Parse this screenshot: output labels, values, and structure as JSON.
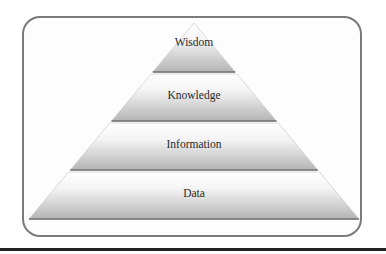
{
  "diagram": {
    "title": "",
    "type": "pyramid",
    "levels": [
      {
        "label": "Wisdom"
      },
      {
        "label": "Knowledge"
      },
      {
        "label": "Information"
      },
      {
        "label": "Data"
      }
    ],
    "colors": {
      "frame_border": "#7a7a7a",
      "band_top": "#ffffff",
      "band_bottom": "#b8b8b8",
      "band_edge": "#6e6e6e",
      "rule": "#222222"
    }
  }
}
